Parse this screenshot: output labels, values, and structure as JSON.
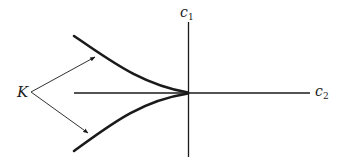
{
  "diagram": {
    "type": "cusp-catastrophe-bifurcation-set",
    "axes": {
      "vertical": {
        "label": "c",
        "subscript": "1"
      },
      "horizontal": {
        "label": "c",
        "subscript": "2"
      }
    },
    "curve_label": "K",
    "colors": {
      "ink": "#1a1a1a",
      "background": "#ffffff"
    }
  }
}
